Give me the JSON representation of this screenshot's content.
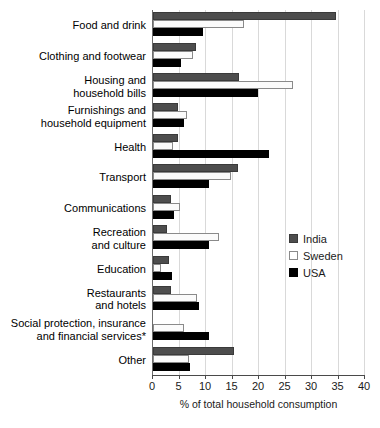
{
  "chart_data": {
    "type": "bar",
    "orientation": "horizontal",
    "title": "",
    "xlabel": "% of total household consumption",
    "ylabel": "",
    "xlim": [
      0,
      40
    ],
    "xticks": [
      0,
      5,
      10,
      15,
      20,
      25,
      30,
      35,
      40
    ],
    "grid": true,
    "legend_position": "middle-right",
    "categories": [
      "Food and drink",
      "Clothing and footwear",
      "Housing and household bills",
      "Furnishings and household equipment",
      "Health",
      "Transport",
      "Communications",
      "Recreation and culture",
      "Education",
      "Restaurants and hotels",
      "Social protection, insurance and financial services*",
      "Other"
    ],
    "category_lines": [
      [
        "Food and drink"
      ],
      [
        "Clothing and footwear"
      ],
      [
        "Housing and",
        "household bills"
      ],
      [
        "Furnishings and",
        "household equipment"
      ],
      [
        "Health"
      ],
      [
        "Transport"
      ],
      [
        "Communications"
      ],
      [
        "Recreation",
        "and culture"
      ],
      [
        "Education"
      ],
      [
        "Restaurants",
        "and hotels"
      ],
      [
        "Social protection, insurance",
        "and financial services*"
      ],
      [
        "Other"
      ]
    ],
    "series": [
      {
        "name": "India",
        "color": "#4d4d4d",
        "values": [
          34.5,
          8.1,
          16.2,
          4.7,
          4.7,
          16.0,
          3.4,
          2.7,
          3.1,
          3.4,
          0.0,
          15.3
        ]
      },
      {
        "name": "Sweden",
        "color": "#ffffff",
        "values": [
          17.2,
          7.5,
          26.4,
          6.5,
          3.7,
          14.7,
          5.0,
          12.4,
          1.5,
          8.3,
          5.9,
          6.8
        ]
      },
      {
        "name": "USA",
        "color": "#000000",
        "values": [
          9.4,
          5.3,
          19.8,
          5.9,
          21.9,
          10.6,
          4.0,
          10.6,
          3.6,
          8.7,
          10.6,
          6.9
        ]
      }
    ]
  },
  "legend": {
    "items": [
      {
        "label": "India",
        "key": "india"
      },
      {
        "label": "Sweden",
        "key": "sweden"
      },
      {
        "label": "USA",
        "key": "usa"
      }
    ]
  },
  "axis": {
    "x_title": "% of total household consumption",
    "tick_labels": [
      "0",
      "5",
      "10",
      "15",
      "20",
      "25",
      "30",
      "35",
      "40"
    ]
  }
}
